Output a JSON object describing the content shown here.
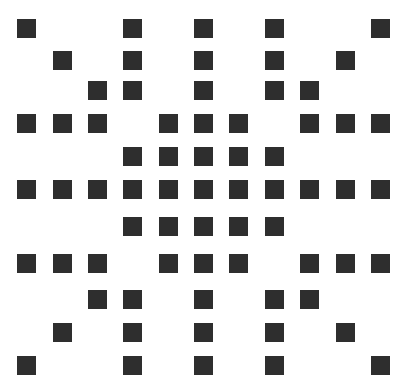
{
  "pattern": {
    "description": "Symmetric dot-matrix pattern of dark squares on white",
    "square_color": "#2e2e2e",
    "background_color": "#ffffff",
    "square_size": 19,
    "columns_x": [
      17,
      53,
      88,
      123,
      159,
      194,
      229,
      265,
      300,
      336,
      371
    ],
    "rows_y": [
      19,
      51,
      81,
      114,
      147,
      180,
      217,
      254,
      290,
      323,
      356
    ],
    "rows": [
      [
        0,
        3,
        5,
        7,
        10
      ],
      [
        1,
        3,
        5,
        7,
        9
      ],
      [
        2,
        3,
        5,
        7,
        8
      ],
      [
        0,
        1,
        2,
        4,
        5,
        6,
        8,
        9,
        10
      ],
      [
        3,
        4,
        5,
        6,
        7
      ],
      [
        0,
        1,
        2,
        3,
        4,
        5,
        6,
        7,
        8,
        9,
        10
      ],
      [
        3,
        4,
        5,
        6,
        7
      ],
      [
        0,
        1,
        2,
        4,
        5,
        6,
        8,
        9,
        10
      ],
      [
        2,
        3,
        5,
        7,
        8
      ],
      [
        1,
        3,
        5,
        7,
        9
      ],
      [
        0,
        3,
        5,
        7,
        10
      ]
    ]
  }
}
